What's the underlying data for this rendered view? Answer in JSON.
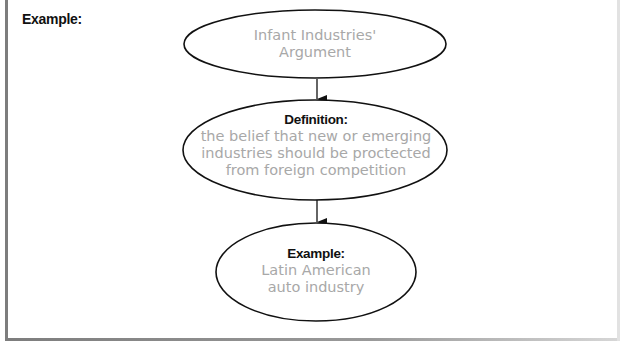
{
  "panel": {
    "label": "Example:"
  },
  "diagram": {
    "line_color": "#111111",
    "text_color": "#a8a8a8",
    "nodes": [
      {
        "heading": "",
        "body": "Infant Industries'\nArgument"
      },
      {
        "heading": "Definition:",
        "body": "the belief that new or emerging\nindustries should be proctected\nfrom foreign competition"
      },
      {
        "heading": "Example:",
        "body": "Latin American\nauto industry"
      }
    ],
    "edges": [
      {
        "from": 0,
        "to": 1
      },
      {
        "from": 1,
        "to": 2
      }
    ]
  }
}
